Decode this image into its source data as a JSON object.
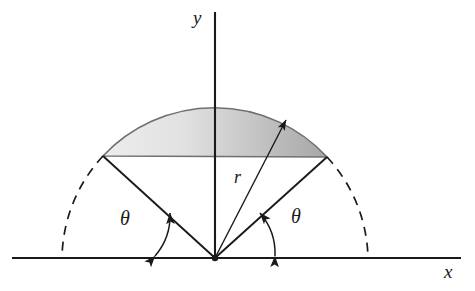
{
  "figure": {
    "type": "geometry-diagram",
    "background_color": "#ffffff",
    "stroke_color": "#1a1a1a"
  },
  "axes": {
    "x_label": "x",
    "y_label": "y",
    "x_axis": {
      "x1": 12,
      "y1": 258,
      "x2": 461,
      "y2": 258
    },
    "y_axis": {
      "x1": 215,
      "y1": 12,
      "x2": 215,
      "y2": 258
    },
    "x_label_pos": {
      "x": 446,
      "y": 264
    },
    "y_label_pos": {
      "x": 194,
      "y": 10
    }
  },
  "circle": {
    "center": {
      "x": 215,
      "y": 258
    },
    "radius": 153,
    "arc_start": {
      "x": 103,
      "y": 156
    },
    "arc_end": {
      "x": 327,
      "y": 157
    },
    "dashed_left_end": {
      "x": 64,
      "y": 258
    },
    "dashed_right_end": {
      "x": 366,
      "y": 258
    }
  },
  "segment": {
    "label": "shaded-circular-segment",
    "fill_light": "#e8e8e8",
    "fill_dark": "#a9a9a9",
    "chord": {
      "x1": 103,
      "y1": 156,
      "x2": 327,
      "y2": 157
    },
    "apex": {
      "x": 215,
      "y": 105
    }
  },
  "radius_annotation": {
    "label": "r",
    "label_pos": {
      "x": 235,
      "y": 175
    },
    "arrow_from": {
      "x": 215,
      "y": 258
    },
    "arrow_to": {
      "x": 287,
      "y": 118
    }
  },
  "angles": [
    {
      "name": "theta-left",
      "label": "θ",
      "label_pos": {
        "x": 123,
        "y": 216
      },
      "from_degrees": 180,
      "to_degrees": 137,
      "arc_radius": 62
    },
    {
      "name": "theta-right",
      "label": "θ",
      "label_pos": {
        "x": 293,
        "y": 214
      },
      "from_degrees": 0,
      "to_degrees": 43,
      "arc_radius": 62
    }
  ],
  "origin_point": {
    "x": 215,
    "y": 258,
    "radius": 3.2
  }
}
